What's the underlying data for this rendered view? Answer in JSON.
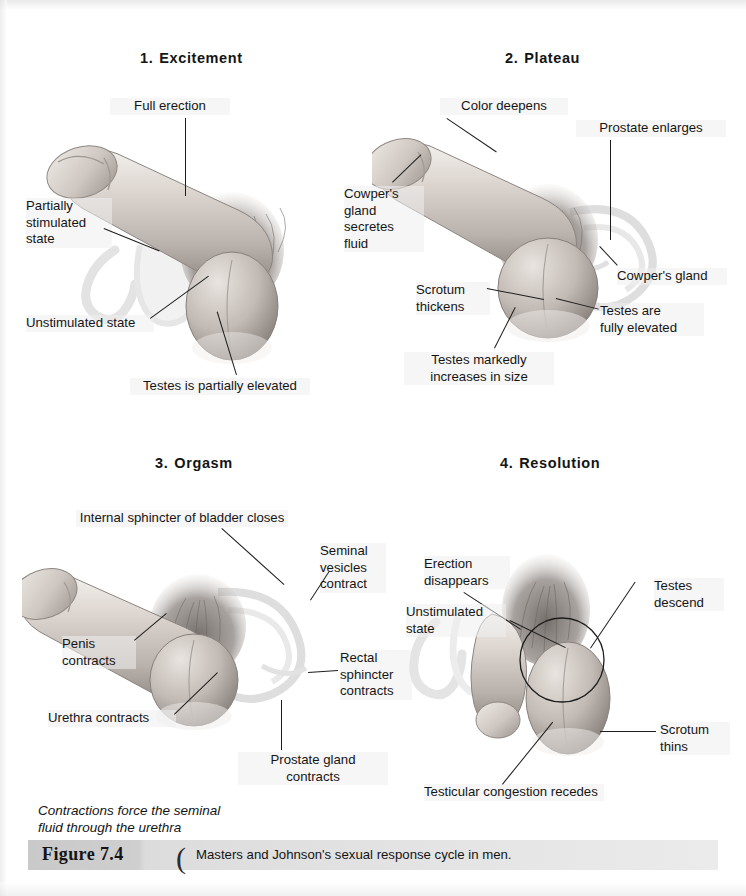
{
  "figure": {
    "label": "Figure 7.4",
    "paren": "(",
    "caption": "Masters and Johnson's sexual response cycle in men."
  },
  "running_caption": "Contractions force the seminal\nfluid through the urethra",
  "panels": [
    {
      "number": "1.",
      "title": "Excitement",
      "labels": [
        {
          "text": "Full erection"
        },
        {
          "text": "Partially\nstimulated\nstate"
        },
        {
          "text": "Unstimulated state"
        },
        {
          "text": "Testes is partially elevated"
        }
      ]
    },
    {
      "number": "2.",
      "title": "Plateau",
      "labels": [
        {
          "text": "Color deepens"
        },
        {
          "text": "Prostate enlarges"
        },
        {
          "text": "Cowper's\ngland\nsecretes\nfluid"
        },
        {
          "text": "Cowper's gland"
        },
        {
          "text": "Scrotum\nthickens"
        },
        {
          "text": "Testes are\nfully elevated"
        },
        {
          "text": "Testes markedly\nincreases in size"
        }
      ]
    },
    {
      "number": "3.",
      "title": "Orgasm",
      "labels": [
        {
          "text": "Internal sphincter of bladder closes"
        },
        {
          "text": "Seminal\nvesicles\ncontract"
        },
        {
          "text": "Penis\ncontracts"
        },
        {
          "text": "Rectal\nsphincter\ncontracts"
        },
        {
          "text": "Urethra contracts"
        },
        {
          "text": "Prostate gland\ncontracts"
        }
      ]
    },
    {
      "number": "4.",
      "title": "Resolution",
      "labels": [
        {
          "text": "Erection\ndisappears"
        },
        {
          "text": "Testes\ndescend"
        },
        {
          "text": "Unstimulated\nstate"
        },
        {
          "text": "Scrotum\nthins"
        },
        {
          "text": "Testicular congestion recedes"
        }
      ]
    }
  ],
  "colors": {
    "ink": "#151515",
    "bar_start": "#c9c9c9",
    "bar_end": "#ebebeb",
    "skin_light": "#e8e3df",
    "skin_mid": "#c6bfb9",
    "skin_dark": "#8e8681",
    "ghost": "#ededed"
  }
}
